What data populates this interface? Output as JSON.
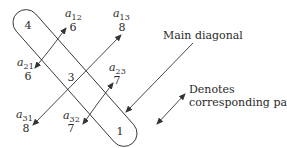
{
  "diagram": {
    "main_diagonal": [
      {
        "id": "a11",
        "value": "4"
      },
      {
        "id": "a22",
        "value": "3"
      },
      {
        "id": "a33",
        "value": "1"
      }
    ],
    "off_diagonal": {
      "a12": {
        "symbol": "a",
        "sub": "12",
        "value": "6"
      },
      "a13": {
        "symbol": "a",
        "sub": "13",
        "value": "8"
      },
      "a21": {
        "symbol": "a",
        "sub": "21",
        "value": "6"
      },
      "a23": {
        "symbol": "a",
        "sub": "23",
        "value": "7"
      },
      "a31": {
        "symbol": "a",
        "sub": "31",
        "value": "8"
      },
      "a32": {
        "symbol": "a",
        "sub": "32",
        "value": "7"
      }
    },
    "pairs": [
      {
        "from": "a12",
        "to": "a21"
      },
      {
        "from": "a13",
        "to": "a31"
      },
      {
        "from": "a23",
        "to": "a32"
      }
    ],
    "legend": {
      "main_diagonal_label": "Main diagonal",
      "pairs_label_line1": "Denotes",
      "pairs_label_line2": "corresponding pairs"
    },
    "colors": {
      "line": "#333333",
      "text": "#2a2a2a",
      "background": "#ffffff"
    }
  }
}
